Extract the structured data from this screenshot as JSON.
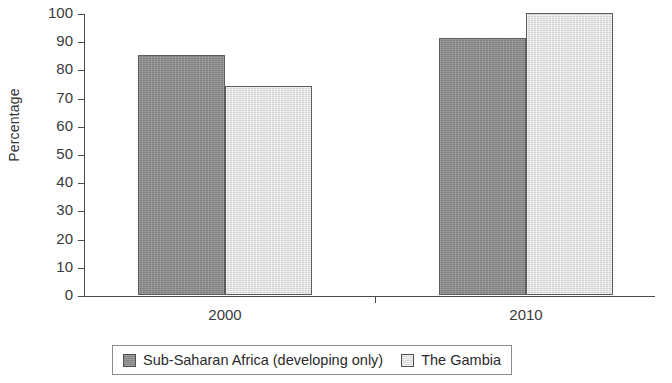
{
  "chart_data": {
    "type": "bar",
    "title": "",
    "xlabel": "",
    "ylabel": "Percentage",
    "categories": [
      "2000",
      "2010"
    ],
    "series": [
      {
        "name": "Sub-Saharan Africa (developing only)",
        "values": [
          85,
          91
        ],
        "color": "#8e8e8e"
      },
      {
        "name": "The Gambia",
        "values": [
          74,
          100
        ],
        "color": "#e6e6e6"
      }
    ],
    "ylim": [
      0,
      100
    ],
    "ytick_labels": [
      "100",
      "90",
      "80",
      "70",
      "60",
      "50",
      "40",
      "30",
      "20",
      "10",
      "0"
    ],
    "ytick_values": [
      100,
      90,
      80,
      70,
      60,
      50,
      40,
      30,
      20,
      10,
      0
    ],
    "grid": false,
    "legend_position": "bottom"
  },
  "legend": {
    "items": [
      {
        "label": "Sub-Saharan Africa (developing only)",
        "swatch": "dark-gray-swatch"
      },
      {
        "label": "The Gambia",
        "swatch": "light-gray-swatch"
      }
    ]
  }
}
